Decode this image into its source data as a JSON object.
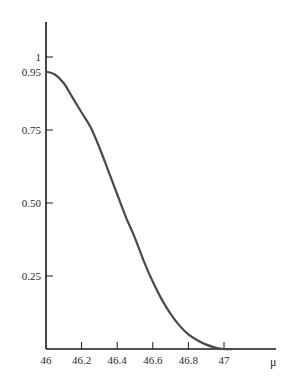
{
  "chart_data": {
    "type": "line",
    "title": "",
    "xlabel": "μ",
    "ylabel": "",
    "xlim": [
      46,
      47.3
    ],
    "ylim": [
      0,
      1.1
    ],
    "grid": false,
    "legend": null,
    "x_ticks": [
      46,
      46.2,
      46.4,
      46.6,
      46.8,
      47
    ],
    "x_tick_labels": [
      "46",
      "46.2",
      "46.4",
      "46.6",
      "46.8",
      "47"
    ],
    "y_ticks": [
      0.25,
      0.5,
      0.75,
      0.95,
      1
    ],
    "y_tick_labels": [
      "0.25",
      "0.50",
      "0.75",
      "0.95",
      "1"
    ],
    "series": [
      {
        "name": "power curve",
        "color": "#4a4a4a",
        "x": [
          46.0,
          46.05,
          46.1,
          46.15,
          46.2,
          46.25,
          46.3,
          46.35,
          46.4,
          46.45,
          46.5,
          46.55,
          46.6,
          46.65,
          46.7,
          46.75,
          46.8,
          46.85,
          46.9,
          46.95,
          47.0,
          47.05
        ],
        "y": [
          0.95,
          0.94,
          0.91,
          0.86,
          0.81,
          0.76,
          0.69,
          0.61,
          0.53,
          0.45,
          0.38,
          0.3,
          0.23,
          0.17,
          0.12,
          0.08,
          0.05,
          0.03,
          0.015,
          0.005,
          0.0,
          0.0
        ]
      }
    ]
  }
}
